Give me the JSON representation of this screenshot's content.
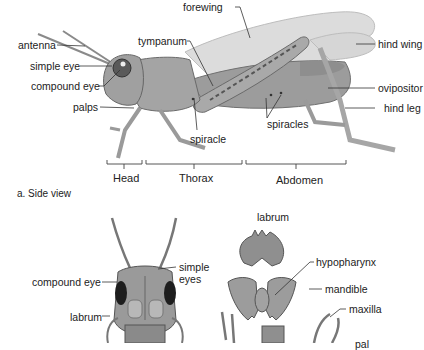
{
  "side_view": {
    "caption": "a. Side view",
    "labels": {
      "forewing": "forewing",
      "antenna": "antenna",
      "tympanum": "tympanum",
      "simple_eye": "simple eye",
      "compound_eye": "compound eye",
      "palps": "palps",
      "spiracle": "spiracle",
      "spiracles": "spiracles",
      "hind_wing": "hind wing",
      "ovipositor": "ovipositor",
      "hind_leg": "hind leg"
    },
    "segments": {
      "head": "Head",
      "thorax": "Thorax",
      "abdomen": "Abdomen"
    }
  },
  "head_view": {
    "labels": {
      "compound_eye": "compound eye",
      "simple_eyes_line1": "simple",
      "simple_eyes_line2": "eyes",
      "labrum": "labrum"
    }
  },
  "mouthparts": {
    "labels": {
      "labrum": "labrum",
      "hypopharynx": "hypopharynx",
      "mandible": "mandible",
      "maxilla": "maxilla",
      "palp_partial": "pal"
    }
  },
  "colors": {
    "body": "#9a9a9a",
    "wing": "#d8d8d8",
    "outline": "#555555",
    "leader": "#333333"
  }
}
